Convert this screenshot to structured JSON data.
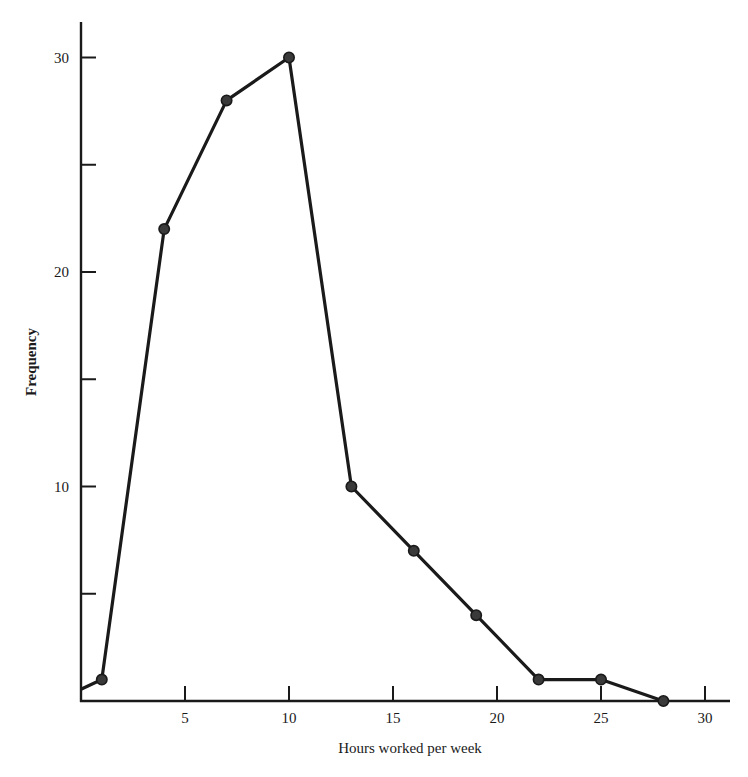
{
  "chart_data": {
    "type": "line",
    "title": "",
    "xlabel": "Hours worked per week",
    "ylabel": "Frequency",
    "xlim": [
      0,
      31
    ],
    "ylim": [
      0,
      32
    ],
    "x_ticks": [
      5,
      10,
      15,
      20,
      25,
      30
    ],
    "x_tick_labels": [
      "5",
      "10",
      "15",
      "20",
      "25",
      "30"
    ],
    "y_ticks": [
      5,
      10,
      15,
      20,
      25,
      30
    ],
    "y_tick_labels": [
      "",
      "10",
      "",
      "20",
      "",
      "30"
    ],
    "grid": false,
    "legend": null,
    "series": [
      {
        "name": "Frequency polygon",
        "start_point": {
          "x": 0,
          "y": 0.5
        },
        "x": [
          1,
          4,
          7,
          10,
          13,
          16,
          19,
          22,
          25,
          28
        ],
        "values": [
          1,
          22,
          28,
          30,
          10,
          7,
          4,
          1,
          1,
          0
        ],
        "marker": "circle",
        "color": "#1a1a1a"
      }
    ]
  },
  "style": {
    "ink_color": "#1a1a1a",
    "marker_color": "#3a3a3a",
    "background": "#ffffff"
  }
}
